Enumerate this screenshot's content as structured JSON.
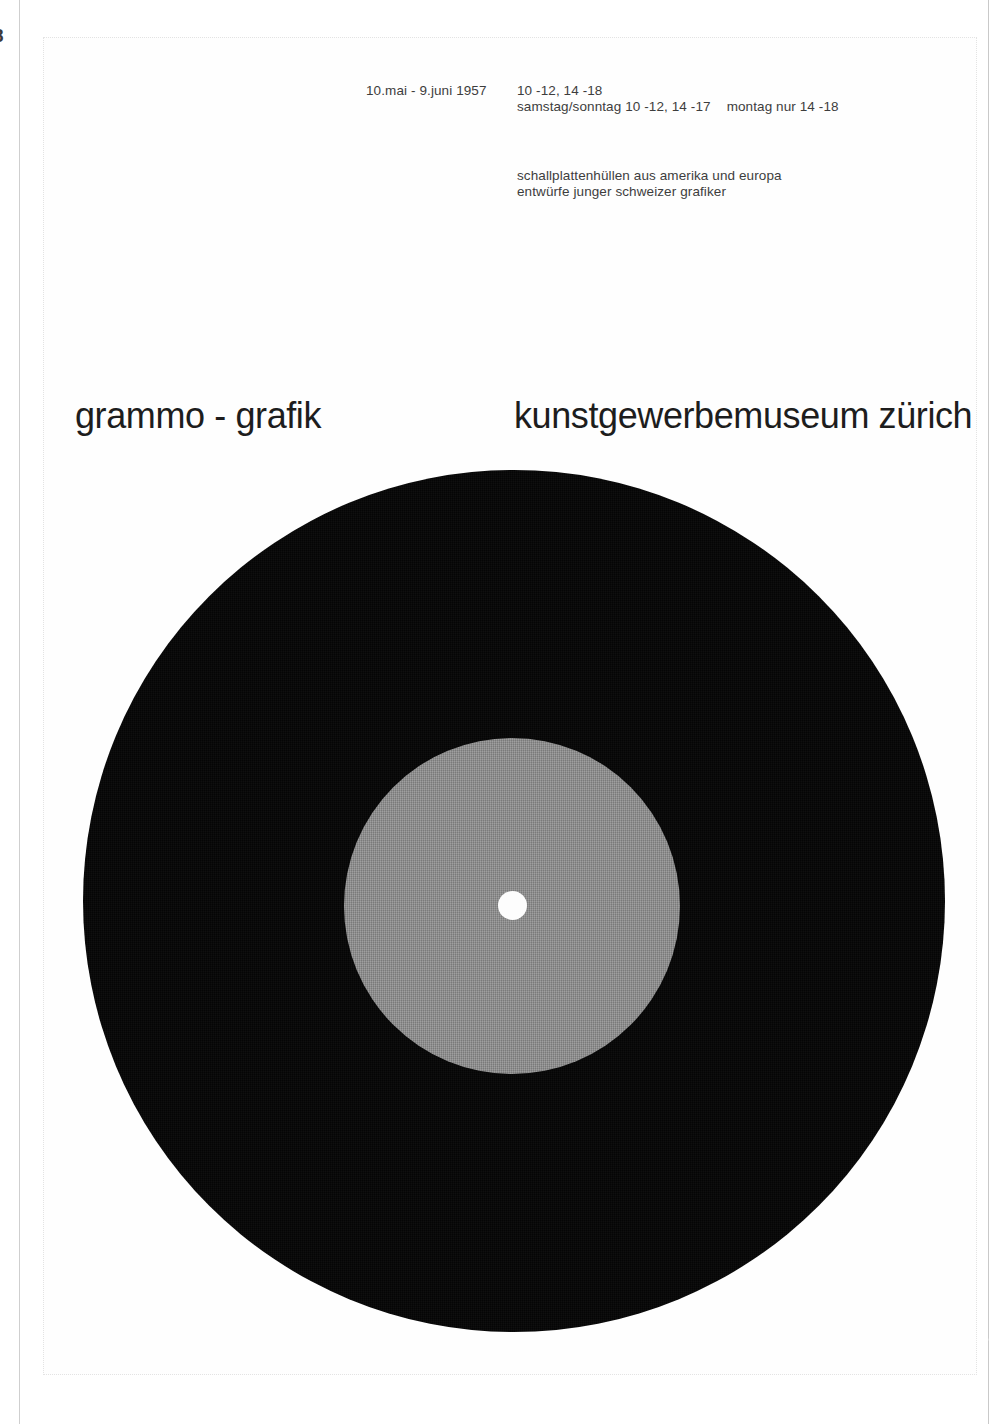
{
  "scan": {
    "page_number": "8",
    "sheet_bg": "#fefefe",
    "canvas_bg": "#ffffff"
  },
  "poster": {
    "header": {
      "dates": "10.mai - 9.juni 1957",
      "hours_line1": "10 -12, 14 -18",
      "hours_line2_weekend": "samstag/sonntag 10 -12, 14 -17",
      "hours_line2_monday": "montag nur 14 -18",
      "subject_line1": "schallplattenhüllen aus amerika und europa",
      "subject_line2": "entwürfe junger schweizer grafiker"
    },
    "title_left": "grammo - grafik",
    "title_right": "kunstgewerbemuseum zürich",
    "colors": {
      "ink": "#1d1d1d",
      "small_text": "#3d3d3d",
      "vinyl": "#050505",
      "label": "#8b8b8b",
      "spindle_hole": "#fdfdfd"
    },
    "artwork": {
      "name": "vinyl-record",
      "disc_diameter_px": 862,
      "label_diameter_px": 336,
      "hole_diameter_px": 29
    }
  }
}
